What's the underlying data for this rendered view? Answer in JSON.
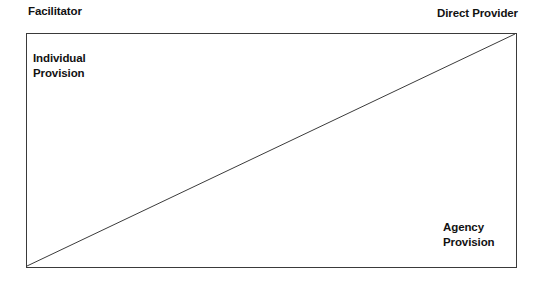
{
  "diagram": {
    "type": "two-axis-continuum",
    "background_color": "#ffffff",
    "line_color": "#3a3a3a",
    "text_color": "#121212",
    "axis_captions": {
      "top_left": "Facilitator",
      "top_right": "Direct Provider"
    },
    "corner_labels": {
      "top_left_line1": "Individual",
      "top_left_line2": "Provision",
      "bottom_right_line1": "Agency",
      "bottom_right_line2": "Provision"
    },
    "diagonal": {
      "from": "bottom-left",
      "to": "top-right",
      "stroke_width": 1
    }
  }
}
